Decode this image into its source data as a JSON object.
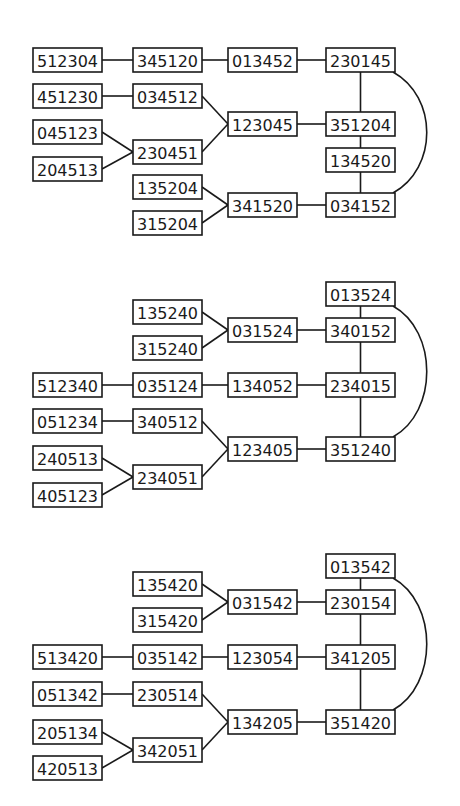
{
  "diagrams": [
    {
      "nodes": [
        {
          "id": "512304",
          "x": 33,
          "y": 48
        },
        {
          "id": "345120",
          "x": 133,
          "y": 48
        },
        {
          "id": "013452",
          "x": 228,
          "y": 48
        },
        {
          "id": "230145",
          "x": 326,
          "y": 48
        },
        {
          "id": "451230",
          "x": 33,
          "y": 84
        },
        {
          "id": "034512",
          "x": 133,
          "y": 84
        },
        {
          "id": "123045",
          "x": 228,
          "y": 112
        },
        {
          "id": "351204",
          "x": 326,
          "y": 112
        },
        {
          "id": "045123",
          "x": 33,
          "y": 120
        },
        {
          "id": "230451",
          "x": 133,
          "y": 140
        },
        {
          "id": "204513",
          "x": 33,
          "y": 157
        },
        {
          "id": "134520",
          "x": 326,
          "y": 148
        },
        {
          "id": "135204",
          "x": 133,
          "y": 175
        },
        {
          "id": "341520",
          "x": 228,
          "y": 193
        },
        {
          "id": "034152",
          "x": 326,
          "y": 193
        },
        {
          "id": "315204",
          "x": 133,
          "y": 211
        }
      ],
      "edges": [
        [
          "512304",
          "345120"
        ],
        [
          "345120",
          "013452"
        ],
        [
          "013452",
          "230145"
        ],
        [
          "451230",
          "034512"
        ],
        [
          "034512",
          "123045"
        ],
        [
          "230451",
          "123045"
        ],
        [
          "123045",
          "351204"
        ],
        [
          "045123",
          "230451"
        ],
        [
          "204513",
          "230451"
        ],
        [
          "230145",
          "351204"
        ],
        [
          "351204",
          "134520"
        ],
        [
          "134520",
          "034152"
        ],
        [
          "135204",
          "341520"
        ],
        [
          "315204",
          "341520"
        ],
        [
          "341520",
          "034152"
        ]
      ],
      "arc": [
        "230145",
        "034152"
      ]
    },
    {
      "nodes": [
        {
          "id": "013524",
          "x": 326,
          "y": 282
        },
        {
          "id": "135240",
          "x": 133,
          "y": 300
        },
        {
          "id": "031524",
          "x": 228,
          "y": 318
        },
        {
          "id": "340152",
          "x": 326,
          "y": 318
        },
        {
          "id": "315240",
          "x": 133,
          "y": 336
        },
        {
          "id": "512340",
          "x": 33,
          "y": 373
        },
        {
          "id": "035124",
          "x": 133,
          "y": 373
        },
        {
          "id": "134052",
          "x": 228,
          "y": 373
        },
        {
          "id": "234015",
          "x": 326,
          "y": 373
        },
        {
          "id": "051234",
          "x": 33,
          "y": 409
        },
        {
          "id": "340512",
          "x": 133,
          "y": 409
        },
        {
          "id": "123405",
          "x": 228,
          "y": 437
        },
        {
          "id": "351240",
          "x": 326,
          "y": 437
        },
        {
          "id": "240513",
          "x": 33,
          "y": 446
        },
        {
          "id": "234051",
          "x": 133,
          "y": 465
        },
        {
          "id": "405123",
          "x": 33,
          "y": 483
        }
      ],
      "edges": [
        [
          "013524",
          "340152"
        ],
        [
          "135240",
          "031524"
        ],
        [
          "315240",
          "031524"
        ],
        [
          "031524",
          "340152"
        ],
        [
          "340152",
          "234015"
        ],
        [
          "512340",
          "035124"
        ],
        [
          "035124",
          "134052"
        ],
        [
          "134052",
          "234015"
        ],
        [
          "234015",
          "351240"
        ],
        [
          "051234",
          "340512"
        ],
        [
          "340512",
          "123405"
        ],
        [
          "234051",
          "123405"
        ],
        [
          "123405",
          "351240"
        ],
        [
          "240513",
          "234051"
        ],
        [
          "405123",
          "234051"
        ]
      ],
      "arc": [
        "013524",
        "351240"
      ]
    },
    {
      "nodes": [
        {
          "id": "013542",
          "x": 326,
          "y": 554
        },
        {
          "id": "135420",
          "x": 133,
          "y": 572
        },
        {
          "id": "031542",
          "x": 228,
          "y": 590
        },
        {
          "id": "230154",
          "x": 326,
          "y": 590
        },
        {
          "id": "315420",
          "x": 133,
          "y": 608
        },
        {
          "id": "513420",
          "x": 33,
          "y": 645
        },
        {
          "id": "035142",
          "x": 133,
          "y": 645
        },
        {
          "id": "123054",
          "x": 228,
          "y": 645
        },
        {
          "id": "341205",
          "x": 326,
          "y": 645
        },
        {
          "id": "051342",
          "x": 33,
          "y": 682
        },
        {
          "id": "230514",
          "x": 133,
          "y": 682
        },
        {
          "id": "134205",
          "x": 228,
          "y": 710
        },
        {
          "id": "351420",
          "x": 326,
          "y": 710
        },
        {
          "id": "205134",
          "x": 33,
          "y": 720
        },
        {
          "id": "342051",
          "x": 133,
          "y": 738
        },
        {
          "id": "420513",
          "x": 33,
          "y": 756
        }
      ],
      "edges": [
        [
          "013542",
          "230154"
        ],
        [
          "135420",
          "031542"
        ],
        [
          "315420",
          "031542"
        ],
        [
          "031542",
          "230154"
        ],
        [
          "230154",
          "341205"
        ],
        [
          "513420",
          "035142"
        ],
        [
          "035142",
          "123054"
        ],
        [
          "123054",
          "341205"
        ],
        [
          "341205",
          "351420"
        ],
        [
          "051342",
          "230514"
        ],
        [
          "230514",
          "134205"
        ],
        [
          "342051",
          "134205"
        ],
        [
          "134205",
          "351420"
        ],
        [
          "205134",
          "342051"
        ],
        [
          "420513",
          "342051"
        ]
      ],
      "arc": [
        "013542",
        "351420"
      ]
    }
  ],
  "style": {
    "stroke": "#1a1a1a",
    "background": "#ffffff",
    "box_width": 69,
    "box_height": 24
  }
}
